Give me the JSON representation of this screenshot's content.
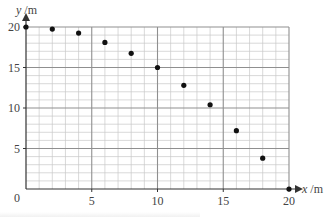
{
  "chart_data": {
    "type": "scatter",
    "title": "",
    "xlabel": "x /m",
    "ylabel": "y /m",
    "xlim": [
      0,
      20
    ],
    "ylim": [
      0,
      20
    ],
    "x_ticks": [
      0,
      5,
      10,
      15,
      20
    ],
    "y_ticks": [
      5,
      10,
      15,
      20
    ],
    "origin_label": "0",
    "grid": {
      "on": true,
      "major_step": 5,
      "minor_step": 1
    },
    "legend": null,
    "series": [
      {
        "name": "points",
        "x": [
          0,
          2,
          4,
          6,
          8,
          10,
          12,
          14,
          16,
          18,
          20
        ],
        "y": [
          20,
          19.75,
          19.25,
          18.1,
          16.75,
          15,
          12.8,
          10.4,
          7.2,
          3.8,
          0
        ]
      }
    ]
  },
  "layout": {
    "plot_left": 26,
    "plot_right": 289,
    "plot_top": 27,
    "plot_bottom": 189,
    "colors": {
      "minor_grid": "#c9c9c9",
      "major_grid": "#8f8f8f",
      "axis": "#333333",
      "point": "#111111",
      "text": "#444444"
    }
  }
}
